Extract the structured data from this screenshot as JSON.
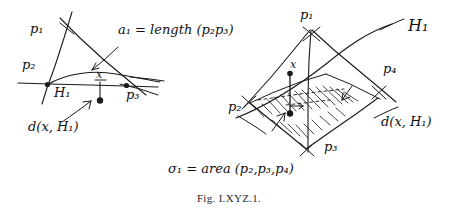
{
  "figure": {
    "caption": "Fig. I.XYZ.1.",
    "ink_color": "#1a1a1a",
    "background": "#ffffff"
  },
  "left_diagram": {
    "name": "planar-triangle-with-hyperplane",
    "vertex_labels": {
      "p1": "p₁",
      "p2": "p₂",
      "p3": "p₃"
    },
    "hyperplane_label": "H₁",
    "point_label": "x",
    "distance_label": "d(x, H₁)",
    "formula": "a₁ = length (p₂p₃)"
  },
  "right_diagram": {
    "name": "spatial-simplex-with-hyperplane",
    "vertex_labels": {
      "p1": "p₁",
      "p2": "p₂",
      "p3": "p₃",
      "p4": "p₄"
    },
    "hyperplane_label": "H₁",
    "point_label": "x",
    "distance_label": "d(x, H₁)",
    "formula": "σ₁ = area (p₂,p₃,p₄)"
  }
}
